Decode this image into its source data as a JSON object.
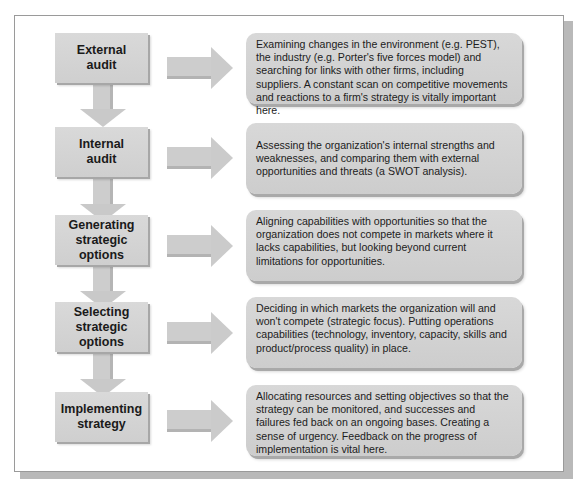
{
  "diagram": {
    "type": "process-flow",
    "colors": {
      "box_fill": "#d4d4d4",
      "box_shadow": "#a7a7a7",
      "arrow_fill": "#cccccc",
      "frame_border": "#9a9a9a",
      "frame_shadow": "#b9b9b9",
      "text": "#1a1a1a"
    },
    "stages": [
      {
        "label": "External\naudit",
        "description": "Examining changes in the environment (e.g. PEST), the industry (e.g. Porter's five forces model) and searching for links with other firms, including suppliers. A constant scan on competitive movements and reactions to a firm's strategy is vitally important here."
      },
      {
        "label": "Internal\naudit",
        "description": "Assessing the organization's internal strengths and weaknesses, and comparing them with external opportunities and threats (a SWOT analysis)."
      },
      {
        "label": "Generating\nstrategic\noptions",
        "description": "Aligning capabilities with opportunities so that the organization does not compete in markets where it lacks capabilities, but looking beyond current limitations for opportunities."
      },
      {
        "label": "Selecting\nstrategic\noptions",
        "description": "Deciding in which markets the organization will and won't compete  (strategic focus). Putting operations capabilities (technology, inventory, capacity, skills and product/process quality) in place."
      },
      {
        "label": "Implementing\nstrategy",
        "description": "Allocating resources and setting objectives so that the strategy can be monitored, and successes and failures fed back on an ongoing bases. Creating a sense of urgency. Feedback on the progress of implementation is vital here."
      }
    ]
  }
}
